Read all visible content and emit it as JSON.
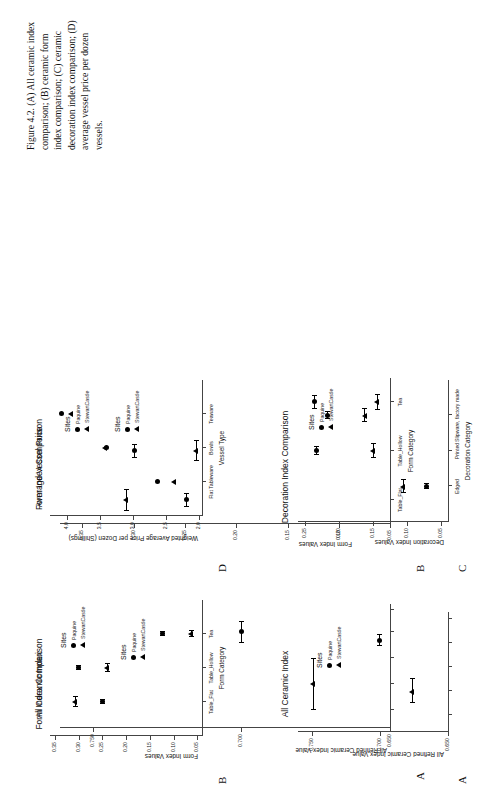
{
  "figure": {
    "caption": "Figure 4.2. (A) All ceramic index comparison; (B) ceramic form index comparison; (C) ceramic decoration index comparison; (D) average vessel price per dozen vessels."
  },
  "legend": {
    "title": "Sites",
    "items": [
      {
        "label": "Paquine",
        "marker": "circle-marker"
      },
      {
        "label": "StewartCastle",
        "marker": "triangle-marker"
      }
    ]
  },
  "panels": {
    "A": {
      "letter": "A",
      "title": "All Ceramic Index",
      "ylabel": "All Refined Ceramic Index Value",
      "xlabel": "",
      "yticks": [
        "0.650",
        "0.700",
        "0.750"
      ]
    },
    "B": {
      "letter": "B",
      "title": "Form Index Comparison",
      "ylabel": "Form Index Values",
      "xlabel": "Form Category",
      "yticks": [
        "0.05",
        "0.10",
        "0.15",
        "0.20",
        "0.25",
        "0.30",
        "0.35"
      ],
      "xticks": [
        "Table_Flat",
        "Table_Hollow",
        "Tea"
      ]
    },
    "C": {
      "letter": "C",
      "title": "Decoration Index Comparison",
      "ylabel": "Decoration Index Values",
      "xlabel": "Decoration Category",
      "yticks": [
        "0.05",
        "0.10",
        "0.15",
        "0.20",
        "0.25"
      ],
      "xticks": [
        "Edged",
        "Printed",
        "Slipware, factory made"
      ]
    },
    "D": {
      "letter": "D",
      "title": "Average Vessel Price",
      "ylabel": "Weighted Average Price per Dozen (Shillings)",
      "xlabel": "Vessel Type",
      "yticks": [
        "2.0",
        "2.5",
        "3.0",
        "3.5",
        "4.0"
      ],
      "xticks": [
        "Flat Tableware",
        "Bowls",
        "Teaware"
      ]
    }
  },
  "chart_data": [
    {
      "type": "scatter",
      "panel": "A",
      "title": "All Ceramic Index",
      "xlabel": "",
      "ylabel": "All Refined Ceramic Index Value",
      "ylim": [
        0.65,
        0.76
      ],
      "categories": [
        "All Refined"
      ],
      "series": [
        {
          "name": "Paquine",
          "marker": "circle",
          "values": [
            0.7
          ],
          "errors": [
            0.004
          ]
        },
        {
          "name": "StewartCastle",
          "marker": "triangle",
          "values": [
            0.676
          ],
          "errors": [
            0.009
          ]
        }
      ],
      "grid": false,
      "legend_position": "upper-right"
    },
    {
      "type": "scatter",
      "panel": "B",
      "title": "Form Index Comparison",
      "xlabel": "Form Category",
      "ylabel": "Form Index Values",
      "ylim": [
        0.04,
        0.36
      ],
      "categories": [
        "Table_Flat",
        "Table_Hollow",
        "Tea"
      ],
      "series": [
        {
          "name": "Paquine",
          "marker": "circle",
          "values": [
            0.249,
            0.3,
            0.124
          ],
          "errors": [
            0.004,
            0.004,
            0.004
          ]
        },
        {
          "name": "StewartCastle",
          "marker": "triangle",
          "values": [
            0.307,
            0.239,
            0.063
          ],
          "errors": [
            0.01,
            0.009,
            0.006
          ]
        }
      ],
      "grid": false,
      "legend_position": "upper-right"
    },
    {
      "type": "scatter",
      "panel": "C",
      "title": "Decoration Index Comparison",
      "xlabel": "Decoration Category",
      "ylabel": "Decoration Index Values",
      "ylim": [
        0.04,
        0.26
      ],
      "categories": [
        "Edged",
        "Printed",
        "Slipware, factory made"
      ],
      "series": [
        {
          "name": "Paquine",
          "marker": "circle",
          "values": [
            0.072,
            0.233,
            0.217
          ],
          "errors": [
            0.003,
            0.006,
            0.005
          ]
        },
        {
          "name": "StewartCastle",
          "marker": "triangle",
          "values": [
            0.105,
            0.15,
            0.162
          ],
          "errors": [
            0.009,
            0.01,
            0.01
          ]
        }
      ],
      "grid": false,
      "legend_position": "upper-right"
    },
    {
      "type": "scatter",
      "panel": "D",
      "title": "Average Vessel Price",
      "xlabel": "Vessel Type",
      "ylabel": "Weighted Average Price per Dozen (Shillings)",
      "ylim": [
        1.95,
        4.25
      ],
      "categories": [
        "Flat Tableware",
        "Bowls",
        "Teaware"
      ],
      "series": [
        {
          "name": "Paquine",
          "marker": "circle",
          "values": [
            2.62,
            3.4,
            4.08
          ],
          "errors": [
            0,
            0,
            0
          ]
        },
        {
          "name": "StewartCastle",
          "marker": "triangle",
          "values": [
            2.37,
            3.41,
            3.93
          ],
          "errors": [
            0,
            0,
            0
          ]
        }
      ],
      "grid": false,
      "legend_position": "upper-right"
    }
  ]
}
